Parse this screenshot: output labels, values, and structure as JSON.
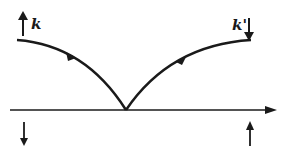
{
  "diagram": {
    "labels": {
      "incoming": "k",
      "outgoing": "k'"
    },
    "colors": {
      "stroke": "#1a1a1a",
      "background": "#ffffff"
    },
    "elements": [
      {
        "id": "incoming-spin-arrow",
        "direction": "up"
      },
      {
        "id": "outgoing-spin-arrow",
        "direction": "down"
      },
      {
        "id": "incoming-trajectory",
        "direction": "toward-surface"
      },
      {
        "id": "outgoing-trajectory",
        "direction": "away-from-surface"
      },
      {
        "id": "surface-axis",
        "direction": "right"
      },
      {
        "id": "lower-left-spin-arrow",
        "direction": "down"
      },
      {
        "id": "lower-right-spin-arrow",
        "direction": "up"
      }
    ]
  }
}
